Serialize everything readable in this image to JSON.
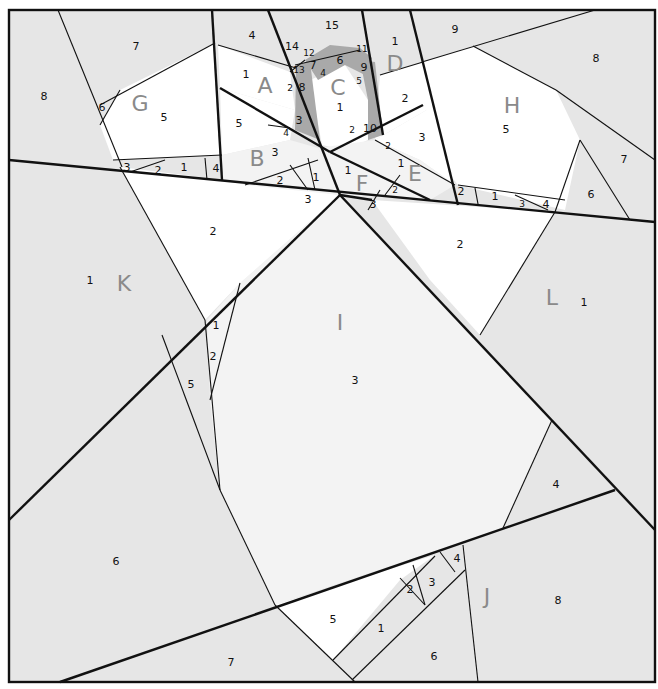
{
  "diagram": {
    "type": "paper-piecing pattern",
    "colors": {
      "light_gray": "#e6e6e6",
      "lighter_gray": "#f3f3f3",
      "white": "#ffffff",
      "dark_gray": "#a9a9a9",
      "line": "#111111",
      "section_letter": "#8a8a8a"
    },
    "sections": {
      "A": {
        "letter": "A",
        "pieces": [
          "1",
          "2",
          "3",
          "4",
          "5"
        ]
      },
      "B": {
        "letter": "B",
        "pieces": [
          "1",
          "2",
          "3",
          "4"
        ]
      },
      "C": {
        "letter": "C",
        "pieces": [
          "1",
          "2",
          "3",
          "4",
          "5",
          "6",
          "7",
          "8",
          "9",
          "10",
          "11",
          "12",
          "13",
          "14",
          "15"
        ]
      },
      "D": {
        "letter": "D",
        "pieces": [
          "1",
          "2"
        ]
      },
      "E": {
        "letter": "E",
        "pieces": [
          "1",
          "2",
          "3"
        ]
      },
      "F": {
        "letter": "F",
        "pieces": [
          "1",
          "2",
          "3"
        ]
      },
      "G": {
        "letter": "G",
        "pieces": [
          "1",
          "2",
          "3",
          "4",
          "5",
          "6",
          "7",
          "8"
        ]
      },
      "H": {
        "letter": "H",
        "pieces": [
          "1",
          "2",
          "3",
          "4",
          "5",
          "6",
          "7",
          "8",
          "9"
        ]
      },
      "I": {
        "letter": "I",
        "pieces": [
          "1",
          "2",
          "3",
          "4",
          "5",
          "6",
          "7"
        ]
      },
      "J": {
        "letter": "J",
        "pieces": [
          "1",
          "2",
          "3",
          "4",
          "5",
          "6",
          "8"
        ]
      },
      "K": {
        "letter": "K",
        "pieces": [
          "1",
          "2"
        ]
      },
      "L": {
        "letter": "L",
        "pieces": [
          "1",
          "2"
        ]
      }
    },
    "labels": {
      "A": "A",
      "B": "B",
      "C": "C",
      "D": "D",
      "E": "E",
      "F": "F",
      "G": "G",
      "H": "H",
      "I": "I",
      "J": "J",
      "K": "K",
      "L": "L",
      "n1": "1",
      "n2": "2",
      "n3": "3",
      "n4": "4",
      "n5": "5",
      "n6": "6",
      "n7": "7",
      "n8": "8",
      "n9": "9",
      "n10": "10",
      "n11": "11",
      "n12": "12",
      "n13": "13",
      "n14": "14",
      "n15": "15"
    }
  }
}
